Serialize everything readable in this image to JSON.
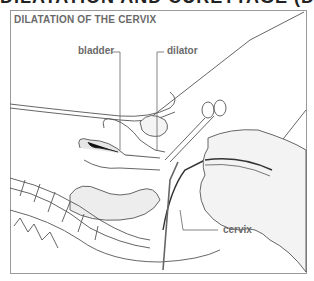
{
  "header": {
    "cut_off_text": "DILATATION AND CURETTAGE (D & C)"
  },
  "figure": {
    "title": "DILATATION OF THE CERVIX",
    "labels": {
      "bladder": "bladder",
      "dilator": "dilator",
      "cervix": "cervix"
    }
  },
  "colors": {
    "line": "#555555",
    "label": "#6a6a6a",
    "frame": "#9a9a9a",
    "shade": "#bdbdbd",
    "dark": "#222222"
  }
}
